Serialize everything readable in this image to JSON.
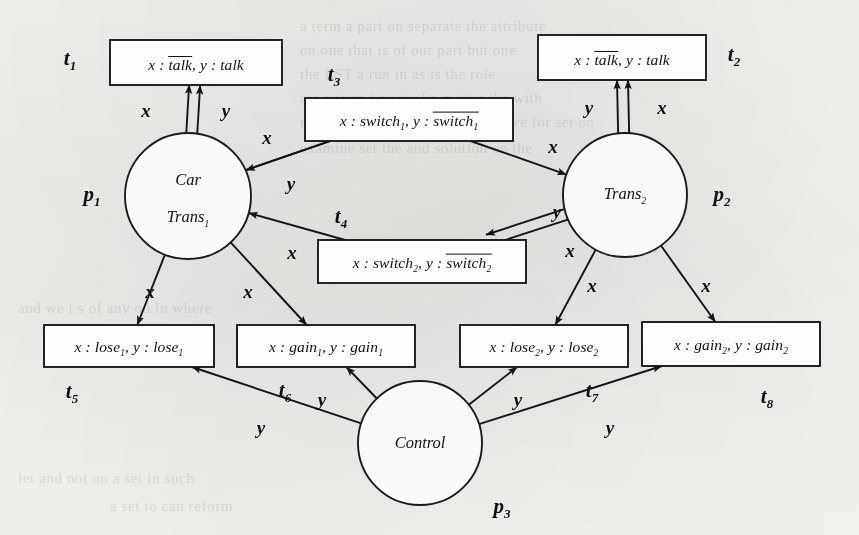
{
  "figure": {
    "type": "petri-net",
    "background_color": "#f6f5f2",
    "ink_color": "#141414"
  },
  "places": [
    {
      "id": "p1",
      "name": "p",
      "index": "1",
      "line1": "Car",
      "line2": "Trans",
      "line2_sub": "1",
      "cx": 188,
      "cy": 196,
      "r": 63,
      "name_x": 92,
      "name_y": 196
    },
    {
      "id": "p2",
      "name": "p",
      "index": "2",
      "line1": "",
      "line2": "Trans",
      "line2_sub": "2",
      "cx": 625,
      "cy": 195,
      "r": 62,
      "name_x": 722,
      "name_y": 196
    },
    {
      "id": "p3",
      "name": "p",
      "index": "3",
      "line1": "",
      "line2": "Control",
      "line2_sub": "",
      "cx": 420,
      "cy": 443,
      "r": 62,
      "name_x": 502,
      "name_y": 508
    }
  ],
  "transitions": [
    {
      "id": "t1",
      "name": "t",
      "index": "1",
      "x": 110,
      "y": 40,
      "w": 172,
      "h": 45,
      "pre": "x :",
      "term1": "talk",
      "term1_sub": "",
      "term1_overline": true,
      "mid": ", y :",
      "term2": "talk",
      "term2_sub": "",
      "term2_overline": false,
      "name_x": 70,
      "name_y": 60
    },
    {
      "id": "t2",
      "name": "t",
      "index": "2",
      "x": 538,
      "y": 35,
      "w": 168,
      "h": 45,
      "pre": "x :",
      "term1": "talk",
      "term1_sub": "",
      "term1_overline": true,
      "mid": ", y :",
      "term2": "talk",
      "term2_sub": "",
      "term2_overline": false,
      "name_x": 734,
      "name_y": 56
    },
    {
      "id": "t3",
      "name": "t",
      "index": "3",
      "x": 305,
      "y": 98,
      "w": 208,
      "h": 43,
      "pre": "x :",
      "term1": "switch",
      "term1_sub": "1",
      "term1_overline": false,
      "mid": ", y :",
      "term2": "switch",
      "term2_sub": "1",
      "term2_overline": true,
      "name_x": 334,
      "name_y": 76
    },
    {
      "id": "t4",
      "name": "t",
      "index": "4",
      "x": 318,
      "y": 240,
      "w": 208,
      "h": 43,
      "pre": "x :",
      "term1": "switch",
      "term1_sub": "2",
      "term1_overline": false,
      "mid": ", y :",
      "term2": "switch",
      "term2_sub": "2",
      "term2_overline": true,
      "name_x": 341,
      "name_y": 218
    },
    {
      "id": "t5",
      "name": "t",
      "index": "5",
      "x": 44,
      "y": 325,
      "w": 170,
      "h": 42,
      "pre": "x :",
      "term1": "lose",
      "term1_sub": "1",
      "term1_overline": false,
      "mid": ", y :",
      "term2": "lose",
      "term2_sub": "1",
      "term2_overline": false,
      "name_x": 72,
      "name_y": 393
    },
    {
      "id": "t6",
      "name": "t",
      "index": "6",
      "x": 237,
      "y": 325,
      "w": 178,
      "h": 42,
      "pre": "x :",
      "term1": "gain",
      "term1_sub": "1",
      "term1_overline": false,
      "mid": ", y :",
      "term2": "gain",
      "term2_sub": "1",
      "term2_overline": false,
      "name_x": 285,
      "name_y": 392
    },
    {
      "id": "t7",
      "name": "t",
      "index": "7",
      "x": 460,
      "y": 325,
      "w": 168,
      "h": 42,
      "pre": "x :",
      "term1": "lose",
      "term1_sub": "2",
      "term1_overline": false,
      "mid": ", y :",
      "term2": "lose",
      "term2_sub": "2",
      "term2_overline": false,
      "name_x": 592,
      "name_y": 392
    },
    {
      "id": "t8",
      "name": "t",
      "index": "8",
      "x": 642,
      "y": 322,
      "w": 178,
      "h": 44,
      "pre": "x :",
      "term1": "gain",
      "term1_sub": "2",
      "term1_overline": false,
      "mid": ", y :",
      "term2": "gain",
      "term2_sub": "2",
      "term2_overline": false,
      "name_x": 767,
      "name_y": 398
    }
  ],
  "arcs": [
    {
      "from": "p1",
      "to": "t1",
      "label": "x",
      "bidirectional": true,
      "label_x": 146,
      "label_y": 111
    },
    {
      "from": "p1",
      "to": "t1",
      "label": "y",
      "bidirectional": true,
      "label_x": 226,
      "label_y": 111
    },
    {
      "from": "p2",
      "to": "t2",
      "label": "y",
      "bidirectional": true,
      "label_x": 589,
      "label_y": 108
    },
    {
      "from": "p2",
      "to": "t2",
      "label": "x",
      "bidirectional": true,
      "label_x": 662,
      "label_y": 108
    },
    {
      "from": "p1",
      "to": "t3",
      "label": "x",
      "bidirectional": false,
      "label_x": 267,
      "label_y": 138
    },
    {
      "from": "t3",
      "to": "p1",
      "label": "y",
      "bidirectional": false,
      "label_x": 291,
      "label_y": 184
    },
    {
      "from": "t3",
      "to": "p2",
      "label": "x",
      "bidirectional": false,
      "label_x": 553,
      "label_y": 147
    },
    {
      "from": "t4",
      "to": "p1",
      "label": "x",
      "bidirectional": false,
      "label_x": 292,
      "label_y": 253
    },
    {
      "from": "p2",
      "to": "t4",
      "label": "y",
      "bidirectional": false,
      "label_x": 557,
      "label_y": 212
    },
    {
      "from": "p2",
      "to": "t4",
      "label": "x",
      "bidirectional": false,
      "label_x": 570,
      "label_y": 251
    },
    {
      "from": "p1",
      "to": "t5",
      "label": "x",
      "bidirectional": true,
      "label_x": 150,
      "label_y": 292
    },
    {
      "from": "p1",
      "to": "t6",
      "label": "x",
      "bidirectional": true,
      "label_x": 248,
      "label_y": 292
    },
    {
      "from": "p2",
      "to": "t7",
      "label": "x",
      "bidirectional": true,
      "label_x": 592,
      "label_y": 286
    },
    {
      "from": "p2",
      "to": "t8",
      "label": "x",
      "bidirectional": true,
      "label_x": 706,
      "label_y": 286
    },
    {
      "from": "p3",
      "to": "t5",
      "label": "y",
      "bidirectional": true,
      "label_x": 261,
      "label_y": 428
    },
    {
      "from": "p3",
      "to": "t6",
      "label": "y",
      "bidirectional": true,
      "label_x": 322,
      "label_y": 400
    },
    {
      "from": "p3",
      "to": "t7",
      "label": "y",
      "bidirectional": true,
      "label_x": 518,
      "label_y": 400
    },
    {
      "from": "p3",
      "to": "t8",
      "label": "y",
      "bidirectional": true,
      "label_x": 610,
      "label_y": 428
    }
  ],
  "ghost_text": [
    {
      "text": "a term   a part on separate the attribute",
      "x": 300,
      "y": 18
    },
    {
      "text": "on one that is of our part but one",
      "x": 300,
      "y": 42
    },
    {
      "text": "the LST  a run in as is the role",
      "x": 300,
      "y": 66
    },
    {
      "text": "ate  a term i a set of a matter the with",
      "x": 300,
      "y": 90
    },
    {
      "text": "the  are not surface is how we have for set on",
      "x": 300,
      "y": 114
    },
    {
      "text": "examine  set the  and solution  on the",
      "x": 300,
      "y": 140
    },
    {
      "text": "and we t s of any  on in where",
      "x": 18,
      "y": 300
    },
    {
      "text": "let and  not on a  set in such",
      "x": 18,
      "y": 470
    },
    {
      "text": "a set to can reform",
      "x": 110,
      "y": 498
    }
  ]
}
